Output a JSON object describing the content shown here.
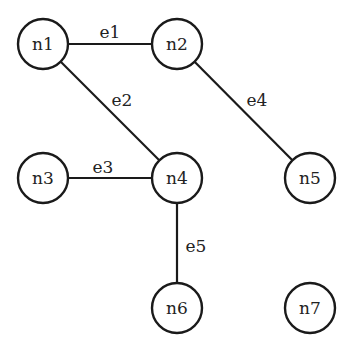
{
  "graph": {
    "nodes": [
      {
        "id": "n1",
        "label": "n1",
        "x": 43,
        "y": 44
      },
      {
        "id": "n2",
        "label": "n2",
        "x": 177,
        "y": 44
      },
      {
        "id": "n3",
        "label": "n3",
        "x": 43,
        "y": 178
      },
      {
        "id": "n4",
        "label": "n4",
        "x": 177,
        "y": 178
      },
      {
        "id": "n5",
        "label": "n5",
        "x": 310,
        "y": 178
      },
      {
        "id": "n6",
        "label": "n6",
        "x": 177,
        "y": 308
      },
      {
        "id": "n7",
        "label": "n7",
        "x": 310,
        "y": 308
      }
    ],
    "edges": [
      {
        "id": "e1",
        "label": "e1",
        "from": "n1",
        "to": "n2",
        "lx": 110,
        "ly": 38
      },
      {
        "id": "e2",
        "label": "e2",
        "from": "n1",
        "to": "n4",
        "lx": 122,
        "ly": 106
      },
      {
        "id": "e3",
        "label": "e3",
        "from": "n3",
        "to": "n4",
        "lx": 103,
        "ly": 173
      },
      {
        "id": "e4",
        "label": "e4",
        "from": "n2",
        "to": "n5",
        "lx": 257,
        "ly": 106
      },
      {
        "id": "e5",
        "label": "e5",
        "from": "n4",
        "to": "n6",
        "lx": 196,
        "ly": 252
      }
    ],
    "node_radius": 25
  }
}
